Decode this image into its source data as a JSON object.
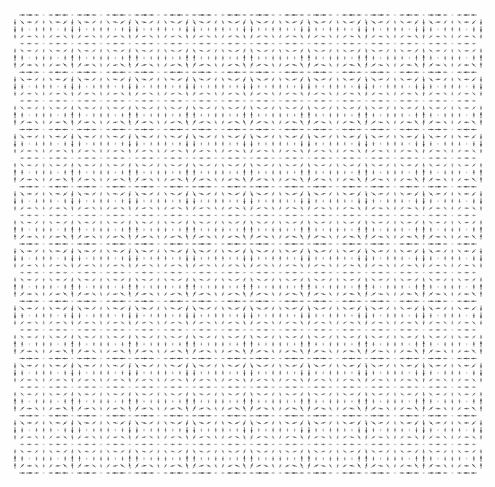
{
  "figure": {
    "width": 495,
    "height": 487,
    "background_color": "#fefefe",
    "title": "",
    "has_axes": false,
    "has_frame": false,
    "has_legend": false,
    "has_colorbar": false,
    "has_tick_labels": false
  },
  "plot_area": {
    "left": 15,
    "top": 15,
    "right": 481,
    "bottom": 473,
    "width": 466,
    "height": 458
  },
  "chart_data": {
    "type": "quiver",
    "title": "",
    "subtitle": "",
    "xlabel": "",
    "ylabel": "",
    "grid": false,
    "legend_position": "none",
    "xlim": [
      0,
      6.283185307179586
    ],
    "ylim": [
      0,
      6.283185307179586
    ],
    "xticks": [],
    "yticks": [],
    "xticklabels": [],
    "yticklabels": [],
    "annotations": [],
    "grid_nx": 66,
    "grid_ny": 65,
    "sample_spacing_px": 7.06,
    "lattice_period_px": 57,
    "lattice_periods_x": 8.2,
    "lattice_periods_y": 8.0,
    "arrow_color": "#3a3a3a",
    "arrow_max_length_px": 6.2,
    "arrow_head_length_px": 2.6,
    "arrow_head_width_px": 2.2,
    "arrow_shaft_width_px": 0.85,
    "field": {
      "formula_u": "sin(k*x) * cos(k*y)",
      "formula_v": "-cos(k*x) * sin(k*y)",
      "wavenumber_k": 8.0,
      "amplitude": 1.0,
      "modulation_formula": "0.45 + 0.55 * |cos(k*x/2) * cos(k*y/2)|",
      "magnitude_min": 0.0,
      "magnitude_max": 1.0,
      "direction_range_deg": [
        0,
        360
      ]
    },
    "opacity": {
      "min": 0.18,
      "max": 0.95,
      "maps_to": "vector magnitude"
    },
    "banding": {
      "dark_band_spacing_px": 57,
      "dark_band_count_y": 8,
      "dark_band_count_x": 8,
      "note": "Rows of high-magnitude arrows create dark horizontal bands; alternating blobs form a checkerboard lattice."
    }
  },
  "accessibility": {
    "alt_text": "Dense quiver plot showing a periodic vector field as a grid of small grey arrows forming a repeating lattice of dark bands and blobs."
  }
}
